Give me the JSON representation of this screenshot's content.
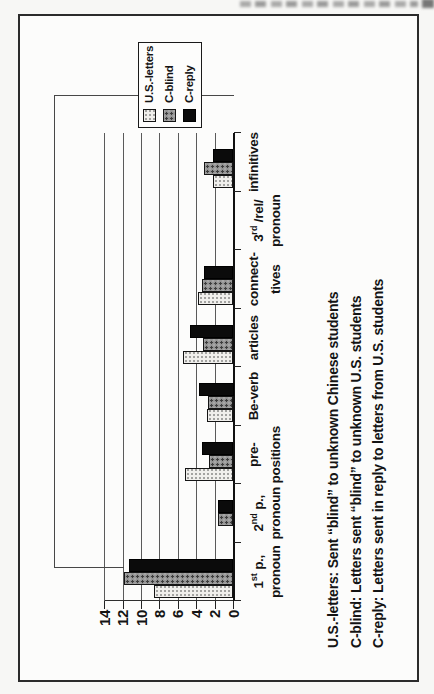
{
  "chart_data": {
    "type": "bar",
    "categories": [
      {
        "parts": {
          "pre": "1",
          "sup": "st",
          "post": " p.,"
        },
        "line2": "pronoun"
      },
      {
        "parts": {
          "pre": "2",
          "sup": "nd",
          "post": " p.,"
        },
        "line2": "pronoun"
      },
      {
        "parts": {
          "pre": "pre-",
          "sup": "",
          "post": ""
        },
        "line2": "positions"
      },
      {
        "parts": {
          "pre": "Be-verb",
          "sup": "",
          "post": ""
        },
        "line2": ""
      },
      {
        "parts": {
          "pre": "articles",
          "sup": "",
          "post": ""
        },
        "line2": ""
      },
      {
        "parts": {
          "pre": "connect-",
          "sup": "",
          "post": ""
        },
        "line2": "tives"
      },
      {
        "parts": {
          "pre": "3",
          "sup": "rd",
          "post": " /rel/"
        },
        "line2": "pronoun"
      },
      {
        "parts": {
          "pre": "infinitives",
          "sup": "",
          "post": ""
        },
        "line2": ""
      }
    ],
    "series": [
      {
        "name": "U.S.-letters",
        "key": "us-letters",
        "values": [
          8.6,
          0,
          5.3,
          2.9,
          5.5,
          3.9,
          0,
          2.2
        ]
      },
      {
        "name": "C-blind",
        "key": "c-blind",
        "values": [
          11.9,
          1.7,
          2.7,
          2.8,
          3.3,
          3.4,
          0,
          3.2
        ]
      },
      {
        "name": "C-reply",
        "key": "c-reply",
        "values": [
          11.4,
          1.7,
          3.4,
          3.75,
          4.7,
          3.2,
          0,
          2.2
        ]
      }
    ],
    "ylim": [
      0,
      14
    ],
    "yticks": [
      0,
      2,
      4,
      6,
      8,
      10,
      12,
      14
    ],
    "grid": true,
    "legend_position": "inside-top-right",
    "page_rotation_deg": -90
  },
  "footnotes": {
    "lines": [
      "U.S.-letters: Sent “blind” to unknown Chinese students",
      "C-blind: Letters sent “blind” to unknown U.S. students",
      "C-reply: Letters sent in reply to letters from U.S. students"
    ]
  },
  "colors": {
    "us_letters_fill": "#f0efec",
    "c_blind_fill": "#929292",
    "c_reply_fill": "#0b0b0b",
    "gridline": "#5a5a5a",
    "axis": "#101010",
    "text": "#141414"
  }
}
